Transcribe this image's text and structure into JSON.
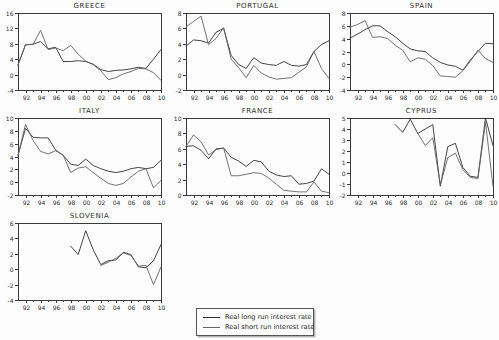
{
  "figure": {
    "background": "#fdfdfd",
    "axis_color": "#3a3a3a",
    "text_color": "#2e2e2e",
    "line_color_long": "#303030",
    "line_color_short": "#636363"
  },
  "legend": {
    "items": [
      {
        "label": "Real long run interest rate"
      },
      {
        "label": "Real short run interest rate"
      }
    ]
  },
  "chart_data": [
    {
      "type": "line",
      "title": "GREECE",
      "x_start": 1991,
      "x_end": 2010,
      "x_tick_labels": [
        "92",
        "94",
        "96",
        "98",
        "00",
        "02",
        "04",
        "06",
        "08",
        "10"
      ],
      "ylim": [
        -4,
        16
      ],
      "y_ticks": [
        -4,
        0,
        4,
        8,
        12,
        16
      ],
      "grid": false,
      "series": [
        {
          "name": "Real long run interest rate",
          "values": [
            2.5,
            7.7,
            7.9,
            8.6,
            6.7,
            7.1,
            3.4,
            3.4,
            3.6,
            3.4,
            2.7,
            1.3,
            0.8,
            1.1,
            1.2,
            1.5,
            1.9,
            1.6,
            4.0,
            6.5
          ]
        },
        {
          "name": "Real short run interest rate",
          "values": [
            2.5,
            7.8,
            7.8,
            11.5,
            6.5,
            6.9,
            6.2,
            7.6,
            5.3,
            3.5,
            2.6,
            1.0,
            -1.3,
            -0.8,
            0.2,
            0.8,
            1.6,
            1.5,
            0.5,
            -1.5
          ]
        }
      ]
    },
    {
      "type": "line",
      "title": "PORTUGAL",
      "x_start": 1991,
      "x_end": 2010,
      "x_tick_labels": [
        "92",
        "94",
        "96",
        "98",
        "00",
        "02",
        "04",
        "06",
        "08",
        "10"
      ],
      "ylim": [
        -2,
        8
      ],
      "y_ticks": [
        -2,
        0,
        2,
        4,
        6,
        8
      ],
      "grid": false,
      "series": [
        {
          "name": "Real long run interest rate",
          "values": [
            3.7,
            4.5,
            4.4,
            4.1,
            5.5,
            6.0,
            2.5,
            1.3,
            0.8,
            2.2,
            1.5,
            1.3,
            1.2,
            1.7,
            1.2,
            1.1,
            1.3,
            3.0,
            3.9,
            4.4
          ]
        },
        {
          "name": "Real short run interest rate",
          "values": [
            6.2,
            6.9,
            7.6,
            3.9,
            4.7,
            6.1,
            2.0,
            0.9,
            -0.4,
            1.2,
            0.2,
            -0.3,
            -0.6,
            -0.5,
            -0.4,
            0.3,
            1.0,
            3.0,
            0.8,
            -0.5
          ]
        }
      ]
    },
    {
      "type": "line",
      "title": "SPAIN",
      "x_start": 1991,
      "x_end": 2010,
      "x_tick_labels": [
        "92",
        "94",
        "96",
        "98",
        "00",
        "02",
        "04",
        "06",
        "08",
        "10"
      ],
      "ylim": [
        -4,
        8
      ],
      "y_ticks": [
        -4,
        -2,
        0,
        2,
        4,
        6,
        8
      ],
      "grid": false,
      "series": [
        {
          "name": "Real long run interest rate",
          "values": [
            4.1,
            4.7,
            5.4,
            6.0,
            6.0,
            5.1,
            4.3,
            3.3,
            2.4,
            2.1,
            2.0,
            1.0,
            0.3,
            -0.1,
            -0.3,
            -0.9,
            0.7,
            2.0,
            3.3,
            3.2
          ]
        },
        {
          "name": "Real short run interest rate",
          "values": [
            5.8,
            6.2,
            6.8,
            4.2,
            4.3,
            4.0,
            3.0,
            2.2,
            0.4,
            1.0,
            0.8,
            -0.2,
            -1.8,
            -1.9,
            -2.0,
            -1.0,
            0.5,
            2.2,
            0.9,
            0.3
          ]
        }
      ]
    },
    {
      "type": "line",
      "title": "ITALY",
      "x_start": 1991,
      "x_end": 2010,
      "x_tick_labels": [
        "92",
        "94",
        "96",
        "98",
        "00",
        "02",
        "04",
        "06",
        "08",
        "10"
      ],
      "ylim": [
        -2,
        10
      ],
      "y_ticks": [
        -2,
        0,
        2,
        4,
        6,
        8,
        10
      ],
      "grid": false,
      "series": [
        {
          "name": "Real long run interest rate",
          "values": [
            4.2,
            8.4,
            7.0,
            6.9,
            6.9,
            5.0,
            4.2,
            2.8,
            2.6,
            3.6,
            2.6,
            2.1,
            1.7,
            1.5,
            1.7,
            2.1,
            2.3,
            2.1,
            2.3,
            3.4
          ]
        },
        {
          "name": "Real short run interest rate",
          "values": [
            4.2,
            9.0,
            6.5,
            4.8,
            4.4,
            4.9,
            4.2,
            1.5,
            2.2,
            2.4,
            1.5,
            0.6,
            -0.2,
            -0.5,
            -0.2,
            0.8,
            1.7,
            2.1,
            -0.9,
            0.3
          ]
        }
      ]
    },
    {
      "type": "line",
      "title": "FRANCE",
      "x_start": 1991,
      "x_end": 2010,
      "x_tick_labels": [
        "92",
        "94",
        "96",
        "98",
        "00",
        "02",
        "04",
        "06",
        "08",
        "10"
      ],
      "ylim": [
        0,
        10
      ],
      "y_ticks": [
        0,
        2,
        4,
        6,
        8,
        10
      ],
      "grid": false,
      "series": [
        {
          "name": "Real long run interest rate",
          "values": [
            6.3,
            6.4,
            5.8,
            4.7,
            6.0,
            6.1,
            4.9,
            4.4,
            3.7,
            4.5,
            4.3,
            3.1,
            2.6,
            2.4,
            2.5,
            1.4,
            1.5,
            1.8,
            3.4,
            2.7
          ]
        },
        {
          "name": "Real short run interest rate",
          "values": [
            6.3,
            7.8,
            6.9,
            5.2,
            5.9,
            6.1,
            2.5,
            2.5,
            2.7,
            2.9,
            2.8,
            2.2,
            1.4,
            0.6,
            0.5,
            0.4,
            0.4,
            1.7,
            0.5,
            0.3
          ]
        }
      ]
    },
    {
      "type": "line",
      "title": "CYPRUS",
      "x_start": 1991,
      "x_end": 2010,
      "x_tick_labels": [
        "92",
        "94",
        "96",
        "98",
        "00",
        "02",
        "04",
        "06",
        "08",
        "10"
      ],
      "ylim": [
        -2,
        5
      ],
      "y_ticks": [
        -2,
        -1,
        0,
        1,
        2,
        3,
        4,
        5
      ],
      "grid": false,
      "series": [
        {
          "name": "Real long run interest rate",
          "values": [
            null,
            null,
            null,
            null,
            null,
            null,
            4.4,
            3.7,
            4.9,
            3.6,
            4.0,
            4.4,
            -1.2,
            2.4,
            2.7,
            0.5,
            -0.3,
            -0.4,
            5.0,
            2.5
          ]
        },
        {
          "name": "Real short run interest rate",
          "values": [
            null,
            null,
            null,
            null,
            null,
            null,
            null,
            null,
            null,
            3.6,
            2.5,
            3.2,
            -1.1,
            1.4,
            1.8,
            0.3,
            -0.4,
            -0.5,
            4.6,
            -1.2
          ]
        }
      ]
    },
    {
      "type": "line",
      "title": "SLOVENIA",
      "x_start": 1991,
      "x_end": 2010,
      "x_tick_labels": [
        "92",
        "94",
        "96",
        "98",
        "00",
        "02",
        "04",
        "06",
        "08",
        "10"
      ],
      "ylim": [
        -4,
        6
      ],
      "y_ticks": [
        -4,
        -2,
        0,
        2,
        4,
        6
      ],
      "grid": false,
      "series": [
        {
          "name": "Real long run interest rate",
          "values": [
            null,
            null,
            null,
            null,
            null,
            null,
            null,
            3.0,
            1.9,
            5.0,
            2.5,
            0.6,
            1.1,
            1.2,
            2.2,
            1.9,
            0.3,
            0.2,
            1.1,
            3.2
          ]
        },
        {
          "name": "Real short run interest rate",
          "values": [
            null,
            null,
            null,
            null,
            null,
            null,
            null,
            null,
            null,
            null,
            null,
            0.5,
            0.9,
            1.4,
            2.1,
            1.8,
            0.4,
            0.5,
            -2.0,
            0.3
          ]
        }
      ]
    }
  ]
}
